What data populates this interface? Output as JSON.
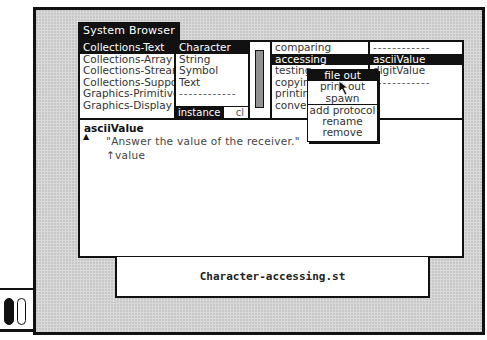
{
  "window": {
    "title": "System Browser"
  },
  "categories": {
    "items": [
      {
        "label": "Collections-Text",
        "selected": true
      },
      {
        "label": "Collections-Array",
        "selected": false
      },
      {
        "label": "Collections-Streams",
        "selected": false
      },
      {
        "label": "Collections-Support",
        "selected": false
      },
      {
        "label": "Graphics-Primitives",
        "selected": false
      },
      {
        "label": "Graphics-Display",
        "selected": false
      }
    ]
  },
  "classes": {
    "items": [
      {
        "label": "Character",
        "selected": true
      },
      {
        "label": "String",
        "selected": false
      },
      {
        "label": "Symbol",
        "selected": false
      },
      {
        "label": "Text",
        "selected": false
      },
      {
        "label": "------------",
        "selected": false
      }
    ],
    "instance_label": "instance",
    "class_label": "cl"
  },
  "protocols": {
    "items": [
      {
        "label": "comparing",
        "selected": false
      },
      {
        "label": "accessing",
        "selected": true
      },
      {
        "label": "testing",
        "selected": false
      },
      {
        "label": "copying",
        "selected": false
      },
      {
        "label": "printing",
        "selected": false
      },
      {
        "label": "converting",
        "selected": false
      }
    ]
  },
  "methods": {
    "items": [
      {
        "label": "------------",
        "selected": false
      },
      {
        "label": "asciiValue",
        "selected": true
      },
      {
        "label": "digitValue",
        "selected": false
      },
      {
        "label": "------------",
        "selected": false
      }
    ]
  },
  "code": {
    "selector": "asciiValue",
    "comment": "\"Answer the value of the receiver.\"",
    "body": "↑value"
  },
  "menu": {
    "items": [
      {
        "label": "file out",
        "selected": true
      },
      {
        "label": "print out",
        "selected": false
      },
      {
        "label": "spawn",
        "selected": false
      },
      {
        "label": "add protocol",
        "selected": false,
        "separator_before": true
      },
      {
        "label": "rename",
        "selected": false
      },
      {
        "label": "remove",
        "selected": false
      }
    ]
  },
  "file_window": {
    "label": "Character-accessing.st"
  },
  "gutter": {
    "toggles": [
      "on",
      "off"
    ]
  }
}
